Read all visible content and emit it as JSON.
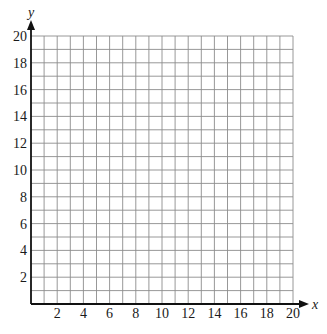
{
  "chart_data": {
    "type": "scatter",
    "title": "",
    "xlabel": "x",
    "ylabel": "y",
    "xlim": [
      0,
      20
    ],
    "ylim": [
      0,
      20
    ],
    "grid": true,
    "grid_step": 1,
    "x_ticks": [
      2,
      4,
      6,
      8,
      10,
      12,
      14,
      16,
      18,
      20
    ],
    "y_ticks": [
      2,
      4,
      6,
      8,
      10,
      12,
      14,
      16,
      18,
      20
    ],
    "x_tick_labels": [
      "2",
      "4",
      "6",
      "8",
      "10",
      "12",
      "14",
      "16",
      "18",
      "20"
    ],
    "y_tick_labels": [
      "2",
      "4",
      "6",
      "8",
      "10",
      "12",
      "14",
      "16",
      "18",
      "20"
    ],
    "series": [],
    "legend": null
  },
  "axes": {
    "x_label": "x",
    "y_label": "y"
  },
  "colors": {
    "grid": "#8c8c8c",
    "axis": "#111111",
    "text": "#1a1a1a",
    "background": "#ffffff"
  }
}
